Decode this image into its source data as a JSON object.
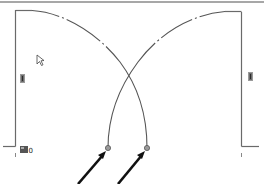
{
  "view": {
    "type": "cad-plan-view",
    "description": "Double door swing in plan view with two crossing swing arcs",
    "colors": {
      "background": "#ffffff",
      "line": "#555555",
      "frame": "#6a6a6a",
      "border": "#8a8a8a",
      "arrow": "#111111",
      "grip": "#8c8c8c"
    }
  },
  "elements": {
    "left_door": {
      "label": "left-door-leaf"
    },
    "right_door": {
      "label": "right-door-leaf"
    },
    "left_grip": {
      "label": "grip"
    },
    "right_grip": {
      "label": "grip"
    },
    "origin_marker": {
      "label": "origin-icon",
      "text": "0"
    },
    "endpoints": [
      {
        "x": 108,
        "y": 148
      },
      {
        "x": 147,
        "y": 148
      }
    ],
    "arrows": [
      {
        "from": [
          78,
          184
        ],
        "to": [
          106,
          151
        ]
      },
      {
        "from": [
          118,
          184
        ],
        "to": [
          145,
          151
        ]
      }
    ],
    "cursor": {
      "x": 37,
      "y": 55
    }
  }
}
